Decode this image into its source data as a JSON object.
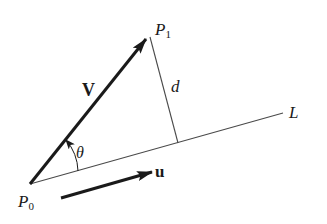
{
  "diagram": {
    "type": "geometry",
    "labels": {
      "p1": "P",
      "p1_sub": "1",
      "p0": "P",
      "p0_sub": "0",
      "v": "V",
      "u": "u",
      "d": "d",
      "line": "L",
      "angle": "θ"
    },
    "points": {
      "P0": [
        30,
        184
      ],
      "P1": [
        148,
        36
      ],
      "foot": [
        178,
        143
      ],
      "L_end": [
        283,
        113
      ]
    },
    "colors": {
      "stroke": "#1a1a1a",
      "thin_line": "#4a4a4a",
      "background": "#ffffff"
    }
  }
}
